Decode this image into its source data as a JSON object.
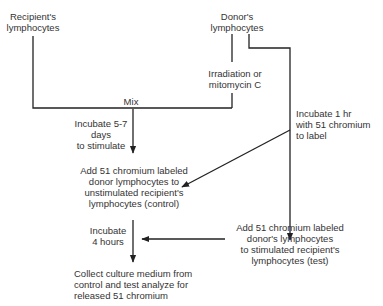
{
  "diagram": {
    "type": "flowchart",
    "nodes": {
      "recipient": {
        "lines": [
          "Recipient's",
          "lymphocytes"
        ]
      },
      "donor": {
        "lines": [
          "Donor's",
          "lymphocytes"
        ]
      },
      "irradiation": {
        "lines": [
          "Irradiation or",
          "mitomycin C"
        ]
      },
      "mix": {
        "text": "Mix"
      },
      "incubate_stimulate": {
        "lines": [
          "Incubate 5-7",
          "days",
          "to stimulate"
        ]
      },
      "incubate_label": {
        "lines": [
          "Incubate 1 hr",
          "with 51 chromium",
          "to label"
        ]
      },
      "control": {
        "lines": [
          "Add 51 chromium labeled",
          "donor lymphocytes to",
          "unstimulated recipient's",
          "lymphocytes (control)"
        ]
      },
      "test": {
        "lines": [
          "Add 51 chromium labeled",
          "donor's lymphocytes",
          "to stimulated recipient's",
          "lymphocytes (test)"
        ]
      },
      "incubate_4h": {
        "lines": [
          "Incubate",
          "4 hours"
        ]
      },
      "collect": {
        "lines": [
          "Collect culture medium from",
          "control and test analyze for",
          "released 51 chromium"
        ]
      }
    },
    "edges": [
      {
        "from": "recipient",
        "to": "mix"
      },
      {
        "from": "donor",
        "to": "irradiation"
      },
      {
        "from": "irradiation",
        "to": "mix"
      },
      {
        "from": "mix",
        "to": "control",
        "label": "incubate_stimulate"
      },
      {
        "from": "donor",
        "to": "test",
        "label": "incubate_label"
      },
      {
        "from": "donor",
        "to": "control",
        "label": "incubate_label"
      },
      {
        "from": "control",
        "to": "collect",
        "label": "incubate_4h"
      },
      {
        "from": "test",
        "to": "collect"
      }
    ],
    "colors": {
      "line": "#222222",
      "text": "#333333",
      "background": "#ffffff"
    }
  }
}
